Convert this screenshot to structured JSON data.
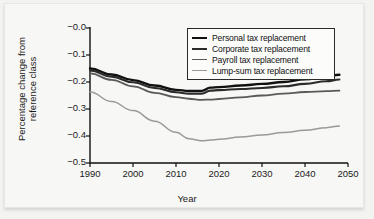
{
  "chart_data": {
    "type": "line",
    "title": "",
    "xlabel": "Year",
    "ylabel": "Percentage change from reference class",
    "ylabel_line1": "Percentage change from",
    "ylabel_line2": "reference class",
    "xlim": [
      1990,
      2050
    ],
    "ylim": [
      -0.5,
      0.0
    ],
    "xticks": [
      1990,
      2000,
      2010,
      2020,
      2030,
      2040,
      2050
    ],
    "xticklabels": [
      "1990",
      "2000",
      "2010",
      "2020",
      "2030",
      "2040",
      "2050"
    ],
    "yticks": [
      0.0,
      -0.1,
      -0.2,
      -0.3,
      -0.4,
      -0.5
    ],
    "yticklabels": [
      "−0.0",
      "−0.1",
      "−0.2",
      "−0.3",
      "−0.4",
      "−0.5"
    ],
    "grid": false,
    "legend_position": "upper right",
    "x": [
      1990,
      1995,
      2000,
      2005,
      2010,
      2013,
      2016,
      2018,
      2020,
      2025,
      2030,
      2035,
      2040,
      2045,
      2048
    ],
    "series": [
      {
        "name": "Personal tax replacement",
        "color": "#111111",
        "values": [
          -0.15,
          -0.172,
          -0.193,
          -0.213,
          -0.229,
          -0.233,
          -0.233,
          -0.221,
          -0.219,
          -0.213,
          -0.207,
          -0.2,
          -0.19,
          -0.179,
          -0.173
        ]
      },
      {
        "name": "Corporate tax replacement",
        "color": "#2b2b2b",
        "values": [
          -0.157,
          -0.18,
          -0.201,
          -0.222,
          -0.238,
          -0.243,
          -0.243,
          -0.232,
          -0.23,
          -0.226,
          -0.222,
          -0.216,
          -0.207,
          -0.197,
          -0.191
        ]
      },
      {
        "name": "Payroll tax replacement",
        "color": "#5a5a5a",
        "values": [
          -0.168,
          -0.192,
          -0.216,
          -0.24,
          -0.256,
          -0.262,
          -0.266,
          -0.265,
          -0.263,
          -0.257,
          -0.25,
          -0.243,
          -0.237,
          -0.234,
          -0.232
        ]
      },
      {
        "name": "Lump-sum tax replacement",
        "color": "#9a9a9a",
        "values": [
          -0.237,
          -0.272,
          -0.306,
          -0.345,
          -0.386,
          -0.41,
          -0.418,
          -0.415,
          -0.412,
          -0.404,
          -0.396,
          -0.387,
          -0.379,
          -0.369,
          -0.363
        ]
      }
    ]
  },
  "legend": {
    "items": [
      {
        "label": "Personal tax replacement",
        "color": "#111111",
        "width": 2.4
      },
      {
        "label": "Corporate tax replacement",
        "color": "#2b2b2b",
        "width": 2.1
      },
      {
        "label": "Payroll tax replacement",
        "color": "#5a5a5a",
        "width": 1.8
      },
      {
        "label": "Lump-sum tax replacement",
        "color": "#9a9a9a",
        "width": 1.5
      }
    ]
  }
}
